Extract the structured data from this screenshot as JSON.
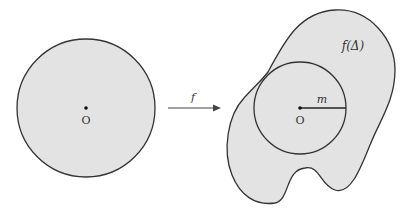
{
  "diagram": {
    "left_disk": {
      "center_label": "O",
      "fill": "#e3e3e3",
      "stroke": "#333333"
    },
    "arrow": {
      "label": "f"
    },
    "right_region": {
      "region_label": "f(Δ)",
      "center_label": "O",
      "radius_label": "m",
      "fill": "#e3e3e3",
      "stroke": "#333333"
    }
  }
}
